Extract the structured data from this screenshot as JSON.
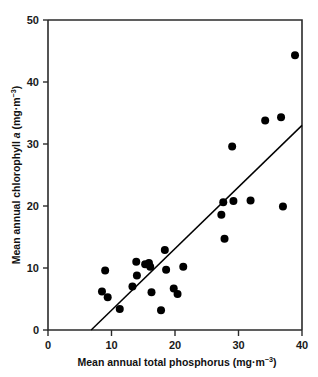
{
  "chart_data": {
    "type": "scatter",
    "title": "",
    "xlabel": "Mean annual total phosphorus (mg·m−3)",
    "ylabel": "Mean annual chlorophyll a (mg·m−3)",
    "xlabel_parts": {
      "main": "Mean annual total phosphorus (mg·m",
      "sup": "−3",
      "tail": ")"
    },
    "ylabel_parts": {
      "pre": "Mean annual chlorophyll ",
      "italic": "a",
      "mid": " (mg·m",
      "sup": "−3",
      "tail": ")"
    },
    "xlim": [
      0,
      40
    ],
    "ylim": [
      0,
      50
    ],
    "xticks": [
      0,
      10,
      20,
      30,
      40
    ],
    "yticks": [
      0,
      10,
      20,
      30,
      40,
      50
    ],
    "xtick_labels": [
      "0",
      "10",
      "20",
      "30",
      "40"
    ],
    "ytick_labels": [
      "0",
      "10",
      "20",
      "30",
      "40",
      "50"
    ],
    "grid": false,
    "legend": false,
    "marker": "filled-circle",
    "marker_color": "#000000",
    "marker_size_px": 8,
    "points": [
      {
        "x": 8.5,
        "y": 6.2
      },
      {
        "x": 9.0,
        "y": 9.6
      },
      {
        "x": 9.4,
        "y": 5.3
      },
      {
        "x": 11.3,
        "y": 3.4
      },
      {
        "x": 13.3,
        "y": 7.0
      },
      {
        "x": 13.9,
        "y": 11.0
      },
      {
        "x": 14.0,
        "y": 8.8
      },
      {
        "x": 15.3,
        "y": 10.6
      },
      {
        "x": 15.9,
        "y": 10.8
      },
      {
        "x": 16.1,
        "y": 10.2
      },
      {
        "x": 16.3,
        "y": 6.1
      },
      {
        "x": 17.8,
        "y": 3.2
      },
      {
        "x": 18.4,
        "y": 12.9
      },
      {
        "x": 18.6,
        "y": 9.7
      },
      {
        "x": 19.8,
        "y": 6.7
      },
      {
        "x": 20.4,
        "y": 5.8
      },
      {
        "x": 21.3,
        "y": 10.2
      },
      {
        "x": 27.3,
        "y": 18.6
      },
      {
        "x": 27.6,
        "y": 20.6
      },
      {
        "x": 27.8,
        "y": 14.7
      },
      {
        "x": 29.0,
        "y": 29.6
      },
      {
        "x": 29.2,
        "y": 20.8
      },
      {
        "x": 31.9,
        "y": 20.9
      },
      {
        "x": 34.2,
        "y": 33.8
      },
      {
        "x": 36.7,
        "y": 34.3
      },
      {
        "x": 37.0,
        "y": 19.9
      },
      {
        "x": 38.9,
        "y": 44.3
      }
    ],
    "fit_line": {
      "label": "regression line",
      "x_start": 6.8,
      "y_start": 0.0,
      "x_end": 40.0,
      "y_end": 33.0
    },
    "colors": {
      "axis": "#2b2b2b",
      "marker": "#000000",
      "fit_line": "#000000",
      "background": "#ffffff",
      "text": "#111111"
    }
  }
}
